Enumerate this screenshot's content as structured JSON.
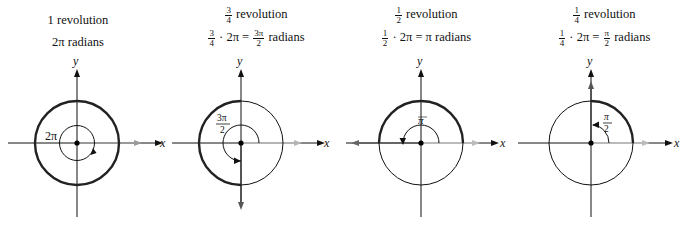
{
  "panels": [
    {
      "id": "full",
      "title_line1": "1 revolution",
      "title_line2": "2π radians",
      "angle_label": "2π",
      "fraction_of_revolution": "1",
      "radians": "2π",
      "axis_x": "x",
      "axis_y": "y"
    },
    {
      "id": "three-quarter",
      "title_frac_num": "3",
      "title_frac_den": "4",
      "title_line1_suffix": "revolution",
      "eq_frac_num": "3",
      "eq_frac_den": "4",
      "eq_mid": "· 2π =",
      "eq_res_num": "3π",
      "eq_res_den": "2",
      "eq_suffix": "radians",
      "angle_label_num": "3π",
      "angle_label_den": "2",
      "axis_x": "x",
      "axis_y": "y"
    },
    {
      "id": "half",
      "title_frac_num": "1",
      "title_frac_den": "2",
      "title_line1_suffix": "revolution",
      "eq_frac_num": "1",
      "eq_frac_den": "2",
      "eq_mid": "· 2π = π radians",
      "angle_label": "π",
      "axis_x": "x",
      "axis_y": "y"
    },
    {
      "id": "quarter",
      "title_frac_num": "1",
      "title_frac_den": "4",
      "title_line1_suffix": "revolution",
      "eq_frac_num": "1",
      "eq_frac_den": "4",
      "eq_mid": "· 2π =",
      "eq_res_num": "π",
      "eq_res_den": "2",
      "eq_suffix": "radians",
      "angle_label_num": "π",
      "angle_label_den": "2",
      "axis_x": "x",
      "axis_y": "y"
    }
  ],
  "colors": {
    "stroke": "#111111",
    "terminal_ray_gray": "#9a9a9a",
    "background": "#ffffff"
  }
}
